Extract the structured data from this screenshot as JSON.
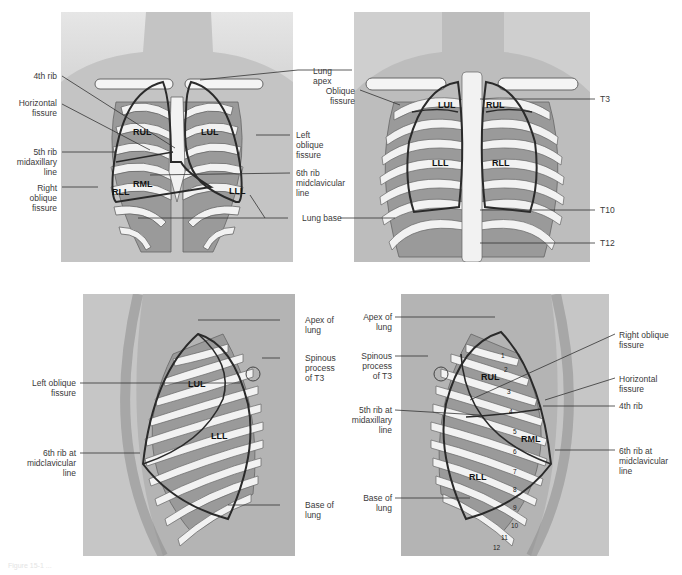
{
  "panels": {
    "anterior": {
      "lobes": [
        "RUL",
        "LUL",
        "RML",
        "RLL",
        "LLL"
      ],
      "labels": {
        "rib4": "4th rib",
        "horizontal_fissure": "Horizontal\nfissure",
        "rib5_midaxillary": "5th rib\nmidaxillary\nline",
        "right_oblique": "Right\noblique\nfissure",
        "lung_apex": "Lung\napex",
        "left_oblique": "Left\noblique\nfissure",
        "rib6_midclavicular": "6th rib\nmidclavicular\nline",
        "lung_base": "Lung base"
      }
    },
    "posterior": {
      "lobes": [
        "LUL",
        "RUL",
        "LLL",
        "RLL"
      ],
      "labels": {
        "oblique_fissure": "Oblique\nfissure",
        "t3": "T3",
        "t10": "T10",
        "t12": "T12"
      }
    },
    "left_lateral": {
      "lobes": [
        "LUL",
        "LLL"
      ],
      "labels": {
        "apex": "Apex of\nlung",
        "spinous": "Spinous\nprocess\nof T3",
        "left_oblique": "Left oblique\nfissure",
        "rib6": "6th rib at\nmidclavicular\nline",
        "base": "Base of\nlung"
      }
    },
    "right_lateral": {
      "lobes": [
        "RUL",
        "RML",
        "RLL"
      ],
      "rib_numbers": [
        "1",
        "2",
        "3",
        "4",
        "5",
        "6",
        "7",
        "8",
        "9",
        "10",
        "11",
        "12"
      ],
      "labels": {
        "apex": "Apex of\nlung",
        "spinous": "Spinous\nprocess\nof T3",
        "rib5": "5th rib at\nmidaxillary\nline",
        "base": "Base of\nlung",
        "right_oblique": "Right oblique\nfissure",
        "horizontal": "Horizontal\nfissure",
        "rib4": "4th rib",
        "rib6": "6th rib at\nmidclavicular\nline"
      }
    }
  },
  "caption": "Figure 15-1 ..."
}
